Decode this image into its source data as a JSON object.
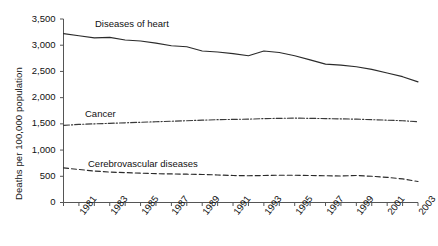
{
  "chart_data": {
    "type": "line",
    "title": "",
    "xlabel": "",
    "ylabel": "Deaths per 100,000 population",
    "xlim": [
      1980,
      2003
    ],
    "ylim": [
      0,
      3500
    ],
    "grid": false,
    "legend_position": "inline-annotations",
    "y_ticks": [
      0,
      500,
      1000,
      1500,
      2000,
      2500,
      3000,
      3500
    ],
    "y_tick_labels": [
      "0",
      "500",
      "1,000",
      "1,500",
      "2,000",
      "2,500",
      "3,000",
      "3,500"
    ],
    "x": [
      1980,
      1981,
      1982,
      1983,
      1984,
      1985,
      1986,
      1987,
      1988,
      1989,
      1990,
      1991,
      1992,
      1993,
      1994,
      1995,
      1996,
      1997,
      1998,
      1999,
      2000,
      2001,
      2002,
      2003
    ],
    "x_tick_labels": [
      "1981",
      "1983",
      "1985",
      "1987",
      "1989",
      "1991",
      "1993",
      "1995",
      "1997",
      "1999",
      "2001",
      "2003"
    ],
    "x_tick_label_years": [
      1981,
      1983,
      1985,
      1987,
      1989,
      1991,
      1993,
      1995,
      1997,
      1999,
      2001,
      2003
    ],
    "series": [
      {
        "name": "Diseases of heart",
        "style": "solid",
        "color": "#2b2b2b",
        "values": [
          3220,
          3180,
          3140,
          3150,
          3100,
          3080,
          3040,
          2990,
          2970,
          2890,
          2870,
          2840,
          2800,
          2890,
          2860,
          2800,
          2720,
          2640,
          2620,
          2590,
          2540,
          2470,
          2400,
          2300
        ]
      },
      {
        "name": "Cancer",
        "style": "dash-dot",
        "color": "#3a3a3a",
        "values": [
          1470,
          1490,
          1500,
          1510,
          1520,
          1530,
          1540,
          1550,
          1560,
          1570,
          1580,
          1585,
          1590,
          1600,
          1605,
          1610,
          1605,
          1600,
          1595,
          1590,
          1580,
          1570,
          1560,
          1540
        ]
      },
      {
        "name": "Cerebrovascular diseases",
        "style": "dashed",
        "color": "#2b2b2b",
        "values": [
          660,
          630,
          600,
          580,
          570,
          560,
          550,
          545,
          540,
          535,
          525,
          515,
          510,
          515,
          520,
          520,
          515,
          510,
          505,
          515,
          500,
          480,
          450,
          400
        ]
      }
    ],
    "annotations": [
      {
        "text": "Diseases of heart",
        "x_px": 95,
        "y_px": 18
      },
      {
        "text": "Cancer",
        "x_px": 85,
        "y_px": 108
      },
      {
        "text": "Cerebrovascular diseases",
        "x_px": 88,
        "y_px": 158
      }
    ]
  },
  "axes": {
    "y_title": "Deaths per 100,000 population"
  }
}
